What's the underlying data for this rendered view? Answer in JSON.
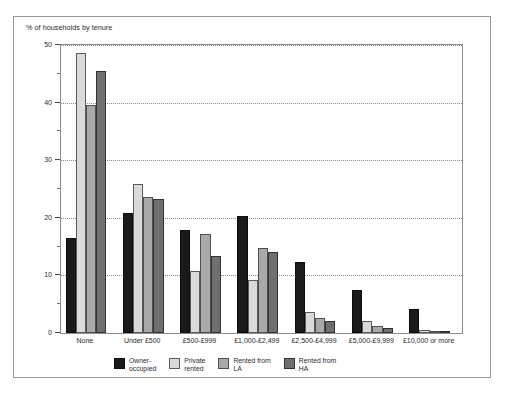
{
  "caption": "% of households by tenure",
  "chart_data": {
    "type": "bar",
    "title": "% of households by tenure",
    "xlabel": "",
    "ylabel": "",
    "ylim": [
      0,
      50
    ],
    "ytick_values": [
      0,
      10,
      20,
      30,
      40,
      50
    ],
    "ytick_labels": [
      "0",
      "10",
      "20",
      "30",
      "40",
      "50"
    ],
    "yminor_values": [
      5,
      15,
      25,
      35,
      45
    ],
    "grid": "horizontal-dotted",
    "legend_position": "bottom",
    "categories": [
      "None",
      "Under £500",
      "£500-£999",
      "£1,000-£2,499",
      "£2,500-£4,999",
      "£5,000-£9,999",
      "£10,000 or more"
    ],
    "series": [
      {
        "name": "Owner-occupied",
        "legend_label": "Owner-\noccupied",
        "color": "#1a1a1a",
        "values": [
          16.5,
          20.8,
          17.8,
          20.3,
          12.3,
          7.5,
          4.2
        ]
      },
      {
        "name": "Private rented",
        "legend_label": "Private\nrented",
        "color": "#dadada",
        "values": [
          48.7,
          25.8,
          10.7,
          9.2,
          3.6,
          2.1,
          0.6
        ]
      },
      {
        "name": "Rented from LA",
        "legend_label": "Rented from\nLA",
        "color": "#a9a9a9",
        "values": [
          39.5,
          23.6,
          17.2,
          14.8,
          2.6,
          1.3,
          0.2
        ]
      },
      {
        "name": "Rented from HA",
        "legend_label": "Rented from\nHA",
        "color": "#6f6f6f",
        "values": [
          45.5,
          23.3,
          13.4,
          14.0,
          2.0,
          0.9,
          0.1
        ]
      }
    ]
  }
}
